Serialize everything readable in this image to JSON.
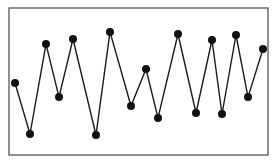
{
  "chart_data": {
    "type": "line",
    "title": "",
    "xlabel": "",
    "ylabel": "",
    "grid": false,
    "legend": null,
    "x": [
      1,
      2,
      3,
      4,
      5,
      6,
      7,
      8,
      9,
      10,
      11,
      12,
      13,
      14,
      15,
      16,
      17
    ],
    "values": [
      48.6,
      13.7,
      75.3,
      39.0,
      78.8,
      13.0,
      83.6,
      32.9,
      58.2,
      24.7,
      82.2,
      28.1,
      78.1,
      27.4,
      81.5,
      39.0,
      71.9
    ],
    "x_positions": [
      15,
      30,
      46,
      59,
      73,
      96,
      110,
      131,
      146,
      158,
      178,
      196,
      212,
      222,
      236,
      248,
      263
    ],
    "ylim": [
      0,
      100
    ],
    "series": [
      {
        "name": "series-1",
        "color": "#1a1a1a",
        "values": [
          48.6,
          13.7,
          75.3,
          39.0,
          78.8,
          13.0,
          83.6,
          32.9,
          58.2,
          24.7,
          82.2,
          28.1,
          78.1,
          27.4,
          81.5,
          39.0,
          71.9
        ]
      }
    ]
  },
  "frame": {
    "left": 9,
    "top": 8,
    "right": 268,
    "bottom": 155,
    "stroke": "#555555"
  },
  "style": {
    "line_color": "#1a1a1a",
    "marker_color": "#111111",
    "marker_radius": 4
  }
}
